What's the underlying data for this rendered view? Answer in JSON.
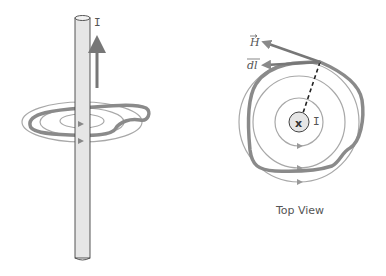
{
  "diagram": {
    "side_view": {
      "current_label": "I",
      "current_direction": "up"
    },
    "top_view": {
      "field_vector_label": "H",
      "path_element_label": "dl",
      "current_label": "I",
      "current_symbol": "x",
      "caption": "Top View"
    },
    "colors": {
      "loop": "#8a8a8a",
      "field_lines": "#a8a8a8",
      "wire_fill": "#e6e6e6",
      "wire_stroke": "#444444",
      "text": "#555555"
    }
  }
}
